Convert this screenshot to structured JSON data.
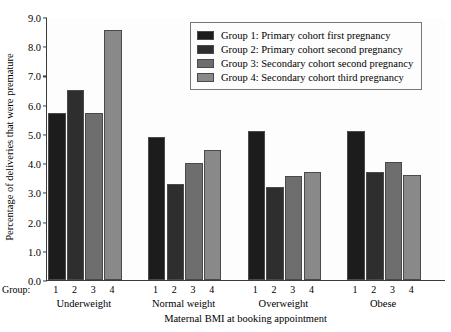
{
  "chart_data": {
    "type": "bar",
    "title": "",
    "xlabel": "Maternal BMI at booking appointment",
    "ylabel": "Percentage of deliveries that were premature",
    "categories": [
      "Underweight",
      "Normal weight",
      "Overweight",
      "Obese"
    ],
    "group_axis_label": "Group:",
    "group_tick_labels": [
      "1",
      "2",
      "3",
      "4"
    ],
    "ylim": [
      0.0,
      9.0
    ],
    "ytick_labels": [
      "0.0",
      "1.0",
      "2.0",
      "3.0",
      "4.0",
      "5.0",
      "6.0",
      "7.0",
      "8.0",
      "9.0"
    ],
    "ytick_values": [
      0.0,
      1.0,
      2.0,
      3.0,
      4.0,
      5.0,
      6.0,
      7.0,
      8.0,
      9.0
    ],
    "grid": false,
    "legend_position": "top-right",
    "series": [
      {
        "name": "Group 1: Primary cohort first pregnancy",
        "color": "#1c1c1c",
        "values": [
          5.7,
          4.9,
          5.1,
          5.1
        ]
      },
      {
        "name": "Group 2: Primary cohort second pregnancy",
        "color": "#2e2e2e",
        "values": [
          6.5,
          3.3,
          3.2,
          3.7
        ]
      },
      {
        "name": "Group 3: Secondary cohort second pregnancy",
        "color": "#6e6e6e",
        "values": [
          5.7,
          4.0,
          3.55,
          4.05
        ]
      },
      {
        "name": "Group 4: Secondary cohort third pregnancy",
        "color": "#898989",
        "values": [
          8.55,
          4.45,
          3.7,
          3.6
        ]
      }
    ]
  }
}
